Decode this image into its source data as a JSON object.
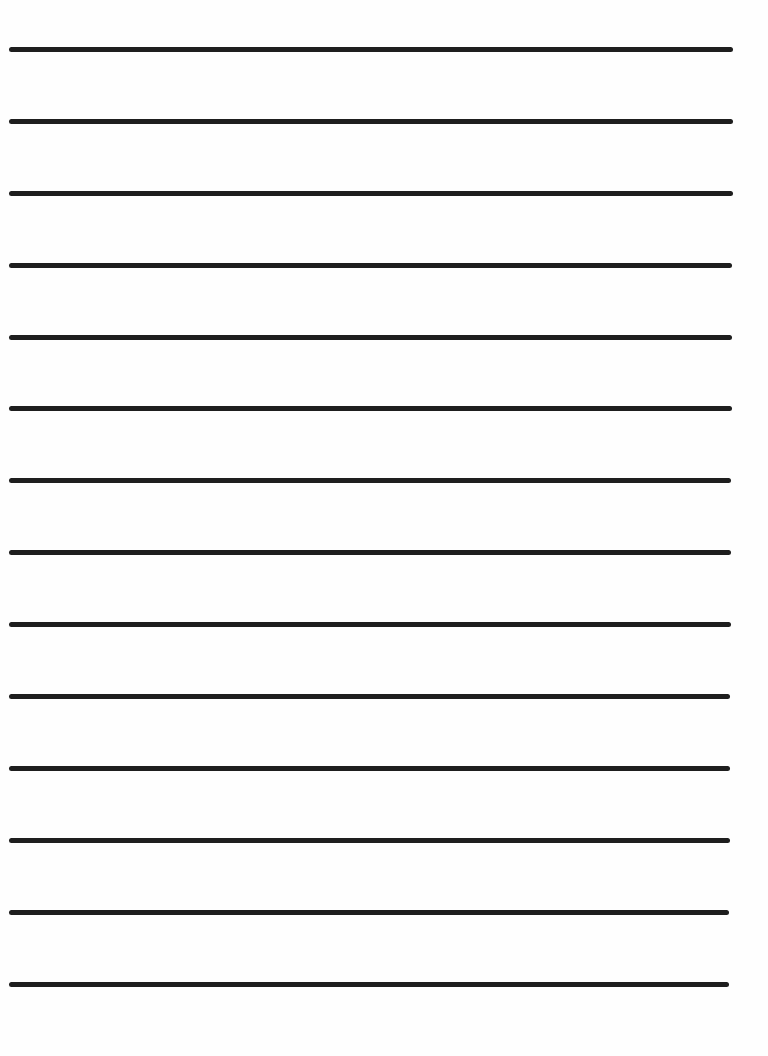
{
  "page": {
    "type": "lined-paper",
    "background_color": "#fefefe",
    "line_color": "#1e1e1e",
    "line_thickness_px": 5,
    "line_count": 14,
    "lines": [
      {
        "y": 49,
        "x_start": 9,
        "x_end": 733
      },
      {
        "y": 121,
        "x_start": 9,
        "x_end": 733
      },
      {
        "y": 193,
        "x_start": 9,
        "x_end": 733
      },
      {
        "y": 265,
        "x_start": 9,
        "x_end": 732
      },
      {
        "y": 337,
        "x_start": 9,
        "x_end": 732
      },
      {
        "y": 408,
        "x_start": 9,
        "x_end": 732
      },
      {
        "y": 480,
        "x_start": 9,
        "x_end": 731
      },
      {
        "y": 552,
        "x_start": 9,
        "x_end": 731
      },
      {
        "y": 624,
        "x_start": 9,
        "x_end": 731
      },
      {
        "y": 696,
        "x_start": 9,
        "x_end": 730
      },
      {
        "y": 768,
        "x_start": 9,
        "x_end": 730
      },
      {
        "y": 840,
        "x_start": 9,
        "x_end": 730
      },
      {
        "y": 912,
        "x_start": 9,
        "x_end": 729
      },
      {
        "y": 984,
        "x_start": 9,
        "x_end": 729
      }
    ]
  }
}
